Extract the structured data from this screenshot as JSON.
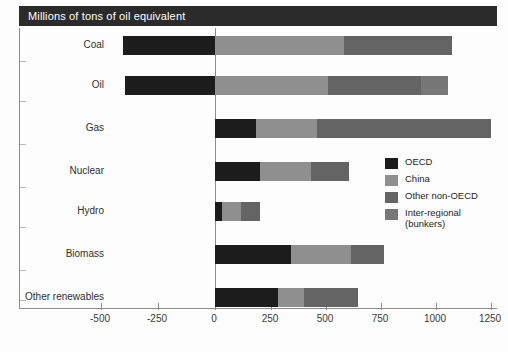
{
  "header": {
    "title": "Millions of tons of oil equivalent"
  },
  "legend": {
    "position": "inside-right",
    "items": [
      {
        "label": "OECD",
        "color": "#1c1c1c"
      },
      {
        "label": "China",
        "color": "#8f8f8f"
      },
      {
        "label": "Other non-OECD",
        "color": "#646464"
      },
      {
        "label": "Inter-regional\n(bunkers)",
        "label_line1": "Inter-regional",
        "label_line2": "(bunkers)",
        "color": "#777777"
      }
    ]
  },
  "chart_data": {
    "type": "bar",
    "orientation": "horizontal",
    "stacked": true,
    "title": "Millions of tons of oil equivalent",
    "xlabel": "",
    "ylabel": "",
    "xlim": [
      -500,
      1250
    ],
    "xticks": [
      -500,
      -250,
      0,
      250,
      500,
      750,
      1000,
      1250
    ],
    "xtick_labels": [
      "-500",
      "-250",
      "0",
      "250",
      "500",
      "750",
      "1000",
      "1250"
    ],
    "grid": false,
    "categories": [
      "Coal",
      "Oil",
      "Gas",
      "Nuclear",
      "Hydro",
      "Biomass",
      "Other renewables"
    ],
    "series": [
      {
        "name": "OECD",
        "color": "#1c1c1c",
        "values": [
          -415,
          -405,
          185,
          205,
          30,
          345,
          285
        ]
      },
      {
        "name": "China",
        "color": "#8f8f8f",
        "values": [
          580,
          510,
          275,
          230,
          85,
          270,
          115
        ]
      },
      {
        "name": "Other non-OECD",
        "color": "#646464",
        "values": [
          485,
          420,
          785,
          170,
          85,
          150,
          240
        ]
      },
      {
        "name": "Inter-regional (bunkers)",
        "color": "#777777",
        "values": [
          0,
          120,
          0,
          0,
          0,
          0,
          0
        ]
      }
    ],
    "totals_positive": [
      1065,
      1050,
      1060,
      400,
      170,
      420,
      355
    ],
    "bar_extent_right": [
      1065,
      1050,
      1245,
      600,
      200,
      765,
      640
    ]
  },
  "xticks_render": [
    {
      "label": "-500",
      "x": 100
    },
    {
      "label": "-250",
      "x": 157
    },
    {
      "label": "0",
      "x": 214
    },
    {
      "label": "250",
      "x": 270
    },
    {
      "label": "500",
      "x": 325
    },
    {
      "label": "750",
      "x": 380
    },
    {
      "label": "1000",
      "x": 435
    },
    {
      "label": "1250",
      "x": 490
    }
  ],
  "rows_render": [
    {
      "label": "Coal",
      "label_y": 39,
      "bar_y": 36,
      "tick_y": 61,
      "segs": [
        {
          "s": "OECD",
          "x": 122,
          "w": 92,
          "c": "#1c1c1c"
        },
        {
          "s": "China",
          "x": 214,
          "w": 129,
          "c": "#8f8f8f"
        },
        {
          "s": "Other non-OECD",
          "x": 343,
          "w": 108,
          "c": "#646464"
        }
      ]
    },
    {
      "label": "Oil",
      "label_y": 79,
      "bar_y": 76,
      "tick_y": 101,
      "segs": [
        {
          "s": "OECD",
          "x": 124,
          "w": 90,
          "c": "#1c1c1c"
        },
        {
          "s": "China",
          "x": 214,
          "w": 113,
          "c": "#8f8f8f"
        },
        {
          "s": "Other non-OECD",
          "x": 327,
          "w": 93,
          "c": "#646464"
        },
        {
          "s": "Inter-regional (bunkers)",
          "x": 420,
          "w": 27,
          "c": "#777777"
        }
      ]
    },
    {
      "label": "Gas",
      "label_y": 122,
      "bar_y": 119,
      "tick_y": 144,
      "segs": [
        {
          "s": "OECD",
          "x": 214,
          "w": 41,
          "c": "#1c1c1c"
        },
        {
          "s": "China",
          "x": 255,
          "w": 61,
          "c": "#8f8f8f"
        },
        {
          "s": "Other non-OECD",
          "x": 316,
          "w": 174,
          "c": "#646464"
        }
      ]
    },
    {
      "label": "Nuclear",
      "label_y": 165,
      "bar_y": 162,
      "tick_y": 187,
      "segs": [
        {
          "s": "OECD",
          "x": 214,
          "w": 45,
          "c": "#1c1c1c"
        },
        {
          "s": "China",
          "x": 259,
          "w": 51,
          "c": "#8f8f8f"
        },
        {
          "s": "Other non-OECD",
          "x": 310,
          "w": 38,
          "c": "#646464"
        }
      ]
    },
    {
      "label": "Hydro",
      "label_y": 205,
      "bar_y": 202,
      "tick_y": 227,
      "segs": [
        {
          "s": "OECD",
          "x": 214,
          "w": 7,
          "c": "#1c1c1c"
        },
        {
          "s": "China",
          "x": 221,
          "w": 19,
          "c": "#8f8f8f"
        },
        {
          "s": "Other non-OECD",
          "x": 240,
          "w": 19,
          "c": "#646464"
        }
      ]
    },
    {
      "label": "Biomass",
      "label_y": 248,
      "bar_y": 245,
      "tick_y": 270,
      "segs": [
        {
          "s": "OECD",
          "x": 214,
          "w": 76,
          "c": "#1c1c1c"
        },
        {
          "s": "China",
          "x": 290,
          "w": 60,
          "c": "#8f8f8f"
        },
        {
          "s": "Other non-OECD",
          "x": 350,
          "w": 33,
          "c": "#646464"
        }
      ]
    },
    {
      "label": "Other renewables",
      "label_y": 291,
      "bar_y": 288,
      "tick_y": 300,
      "segs": [
        {
          "s": "OECD",
          "x": 214,
          "w": 63,
          "c": "#1c1c1c"
        },
        {
          "s": "China",
          "x": 277,
          "w": 26,
          "c": "#8f8f8f"
        },
        {
          "s": "Other non-OECD",
          "x": 303,
          "w": 54,
          "c": "#646464"
        }
      ]
    }
  ]
}
